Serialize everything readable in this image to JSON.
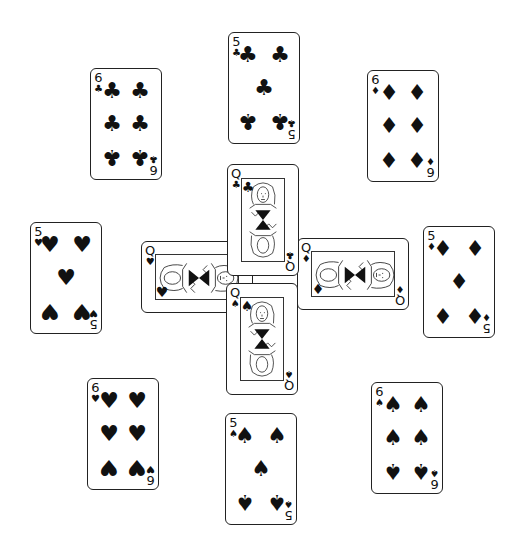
{
  "layout": "card-cross-tableau",
  "cards": [
    {
      "id": "5-clubs-top",
      "rank": "5",
      "suit": "clubs",
      "glyph": "♣",
      "pos": {
        "x": 228,
        "y": 32
      },
      "orientation": "vertical"
    },
    {
      "id": "6-clubs",
      "rank": "6",
      "suit": "clubs",
      "glyph": "♣",
      "pos": {
        "x": 90,
        "y": 68
      },
      "orientation": "vertical"
    },
    {
      "id": "6-diamonds",
      "rank": "6",
      "suit": "diamonds",
      "glyph": "♦",
      "pos": {
        "x": 367,
        "y": 70
      },
      "orientation": "vertical"
    },
    {
      "id": "5-hearts",
      "rank": "5",
      "suit": "hearts",
      "glyph": "♥",
      "pos": {
        "x": 30,
        "y": 222
      },
      "orientation": "vertical"
    },
    {
      "id": "5-diamonds",
      "rank": "5",
      "suit": "diamonds",
      "glyph": "♦",
      "pos": {
        "x": 423,
        "y": 226
      },
      "orientation": "vertical"
    },
    {
      "id": "6-hearts",
      "rank": "6",
      "suit": "hearts",
      "glyph": "♥",
      "pos": {
        "x": 87,
        "y": 378
      },
      "orientation": "vertical"
    },
    {
      "id": "5-spades",
      "rank": "5",
      "suit": "spades",
      "glyph": "♠",
      "pos": {
        "x": 225,
        "y": 413
      },
      "orientation": "vertical"
    },
    {
      "id": "6-spades",
      "rank": "6",
      "suit": "spades",
      "glyph": "♠",
      "pos": {
        "x": 371,
        "y": 382
      },
      "orientation": "vertical"
    }
  ],
  "center": [
    {
      "id": "queen-hearts",
      "rank": "Q",
      "suit": "hearts",
      "glyph": "♥",
      "pos": {
        "x": 141,
        "y": 241
      },
      "orientation": "horizontal"
    },
    {
      "id": "queen-diamonds",
      "rank": "Q",
      "suit": "diamonds",
      "glyph": "♦",
      "pos": {
        "x": 297,
        "y": 238
      },
      "orientation": "horizontal"
    },
    {
      "id": "queen-clubs",
      "rank": "Q",
      "suit": "clubs",
      "glyph": "♣",
      "pos": {
        "x": 227,
        "y": 164
      },
      "orientation": "vertical"
    },
    {
      "id": "queen-spades",
      "rank": "Q",
      "suit": "spades",
      "glyph": "♠",
      "pos": {
        "x": 226,
        "y": 283
      },
      "orientation": "vertical"
    }
  ]
}
